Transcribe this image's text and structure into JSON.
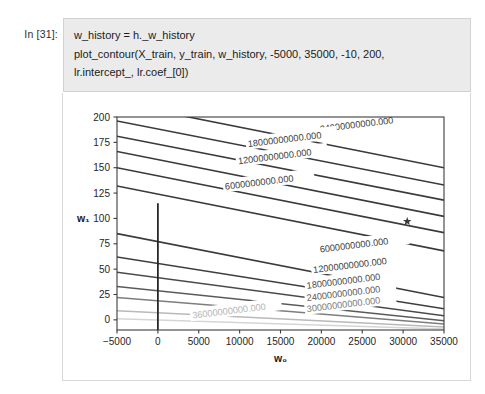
{
  "notebook": {
    "prompt_label": "In [31]:",
    "code_lines": [
      "w_history = h._w_history",
      "plot_contour(X_train, y_train, w_history, -5000, 35000, -10, 200,",
      "lr.intercept_, lr.coef_[0])"
    ]
  },
  "chart_data": {
    "type": "contour",
    "title": "",
    "xlabel": "w₀",
    "ylabel": "w₁",
    "xlim": [
      -5000,
      35000
    ],
    "ylim": [
      -10,
      200
    ],
    "xticks": [
      -5000,
      0,
      5000,
      10000,
      15000,
      20000,
      25000,
      30000,
      35000
    ],
    "xticklabels": [
      "−5000",
      "0",
      "5000",
      "10000",
      "15000",
      "20000",
      "25000",
      "30000",
      "35000"
    ],
    "yticks": [
      0,
      25,
      50,
      75,
      100,
      125,
      150,
      175,
      200
    ],
    "yticklabels": [
      "0",
      "25",
      "50",
      "75",
      "100",
      "125",
      "150",
      "175",
      "200"
    ],
    "grid": false,
    "legend": null,
    "contour_levels": [
      6000000000,
      12000000000,
      18000000000,
      24000000000,
      30000000000,
      36000000000
    ],
    "contour_label_format": "%.3f",
    "labels_upper": [
      {
        "text": "24000000000.000",
        "x": 0.62,
        "y": 0.055,
        "color": "#3b3b3b"
      },
      {
        "text": "18000000000.000",
        "x": 0.4,
        "y": 0.125,
        "color": "#3b3b3b"
      },
      {
        "text": "12000000000.000",
        "x": 0.37,
        "y": 0.205,
        "color": "#3b3b3b"
      },
      {
        "text": "6000000000.000",
        "x": 0.33,
        "y": 0.325,
        "color": "#3b3b3b"
      }
    ],
    "labels_lower": [
      {
        "text": "6000000000.000",
        "x": 0.62,
        "y": 0.62,
        "color": "#3b3b3b"
      },
      {
        "text": "12000000000.000",
        "x": 0.6,
        "y": 0.716,
        "color": "#3b3b3b"
      },
      {
        "text": "18000000000.000",
        "x": 0.58,
        "y": 0.79,
        "color": "#4a4a4a"
      },
      {
        "text": "24000000000.000",
        "x": 0.58,
        "y": 0.848,
        "color": "#5a5a5a"
      },
      {
        "text": "30000000000.000",
        "x": 0.58,
        "y": 0.9,
        "color": "#7a7a7a"
      },
      {
        "text": "36000000000.000",
        "x": 0.23,
        "y": 0.93,
        "color": "#b4b4b4"
      }
    ],
    "trajectory": {
      "name": "w_history",
      "x": 0,
      "y_start": -10,
      "y_end": 115,
      "color": "#262626"
    },
    "optimum_marker": {
      "name": "sklearn solution",
      "marker": "star",
      "x": 30500,
      "y": 97,
      "color": "#3a3a3a"
    }
  },
  "colors": {
    "cell_background": "#ebebeb",
    "cell_border": "#d2d2d2",
    "output_border": "#d8d8d8",
    "axis": "#3d3d3d",
    "text": "#1b1b1b"
  }
}
